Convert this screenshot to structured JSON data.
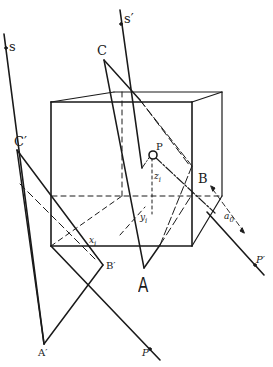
{
  "figure": {
    "type": "geometric construction diagram",
    "labels": {
      "s": "s",
      "s_prime": "s′",
      "C": "C",
      "C_prime": "C′",
      "A": "A",
      "A_prime": "A′",
      "B": "B",
      "B_prime": "B′",
      "P": "P",
      "P_prime": "P′",
      "P_lower": "P",
      "z_i": "z",
      "z_i_sub": "i",
      "y_i": "y",
      "y_i_sub": "i",
      "x_i": "x",
      "x_i_sub": "i",
      "a_0": "a",
      "a_0_sub": "0"
    },
    "colors": {
      "ink": "#1a1a1a",
      "background": "#ffffff"
    }
  }
}
